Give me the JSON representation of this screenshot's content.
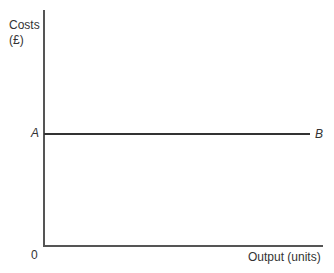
{
  "chart_data": {
    "type": "line",
    "title": "",
    "xlabel": "Output (units)",
    "ylabel": "Costs (£)",
    "ylabel_lines": [
      "Costs",
      "(£)"
    ],
    "origin_label": "0",
    "grid": false,
    "series": [
      {
        "name": "AB",
        "description": "Horizontal line of constant cost (fixed cost)",
        "start_label": "A",
        "end_label": "B",
        "x": [
          0,
          1
        ],
        "y": [
          0.5,
          0.5
        ]
      }
    ],
    "annotations": [
      "A",
      "B"
    ]
  }
}
